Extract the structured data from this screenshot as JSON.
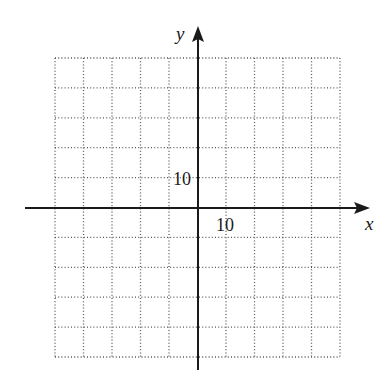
{
  "diagram": {
    "type": "coordinate-grid",
    "x_axis_label": "x",
    "y_axis_label": "y",
    "x_tick_label": "10",
    "y_tick_label": "10",
    "grid": {
      "columns": 10,
      "rows": 10,
      "x_range": [
        -50,
        50
      ],
      "y_range": [
        -50,
        50
      ],
      "scale_per_square": 5,
      "line_style": "dotted",
      "line_color": "#555555"
    },
    "axis_color": "#1a1a1a"
  }
}
